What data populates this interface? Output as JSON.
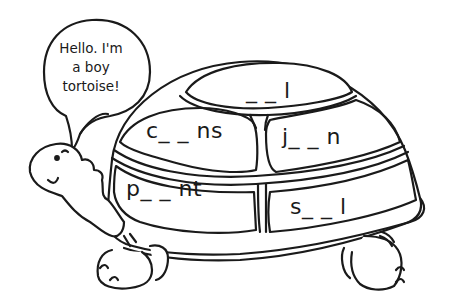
{
  "speech_bubble": {
    "lines": [
      "Hello. I'm",
      "a boy",
      "tortoise!"
    ]
  },
  "shell_words": [
    {
      "id": "top",
      "text": "_ _ l"
    },
    {
      "id": "upper-left",
      "text": "c_ _ ns"
    },
    {
      "id": "upper-right",
      "text": "j_ _ n"
    },
    {
      "id": "lower-left",
      "text": "p_ _ nt"
    },
    {
      "id": "lower-right",
      "text": "s_ _ l"
    }
  ],
  "colors": {
    "ink": "#1a1a1a",
    "background": "#ffffff"
  }
}
